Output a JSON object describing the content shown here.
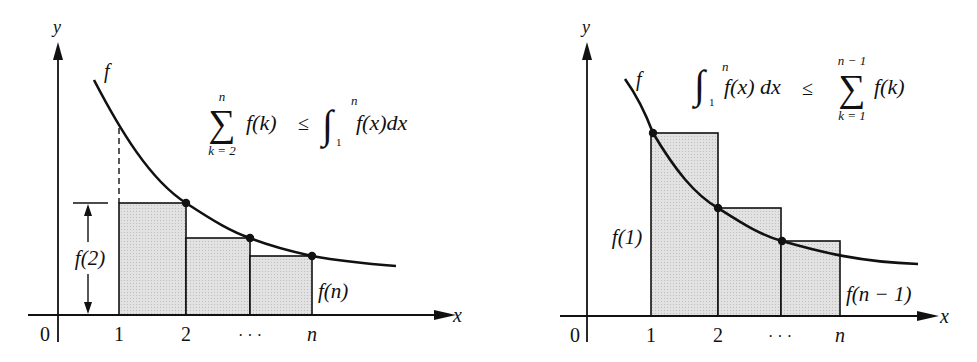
{
  "colors": {
    "ink": "#111111",
    "fill": "#dcdcdc",
    "background": "#ffffff"
  },
  "left_panel": {
    "y_axis_label": "y",
    "x_axis_label": "x",
    "origin_label": "0",
    "curve_label": "f",
    "ticks": [
      "1",
      "2",
      "· · ·",
      "n"
    ],
    "height_label": "f(2)",
    "last_label": "f(n)",
    "formula": {
      "sum_upper": "n",
      "sum_lower": "k = 2",
      "sum_symbol": "∑",
      "sum_term": "f(k)",
      "relation": "≤",
      "integral_symbol": "∫",
      "int_upper": "n",
      "int_lower": "1",
      "integrand": "f(x)dx"
    }
  },
  "right_panel": {
    "y_axis_label": "y",
    "x_axis_label": "x",
    "origin_label": "0",
    "curve_label": "f",
    "ticks": [
      "1",
      "2",
      "· · ·",
      "n"
    ],
    "first_label": "f(1)",
    "last_label": "f(n − 1)",
    "formula": {
      "integral_symbol": "∫",
      "int_upper": "n",
      "int_lower": "1",
      "integrand": "f(x) dx",
      "relation": "≤",
      "sum_symbol": "∑",
      "sum_upper": "n − 1",
      "sum_lower": "k = 1",
      "sum_term": "f(k)"
    }
  }
}
